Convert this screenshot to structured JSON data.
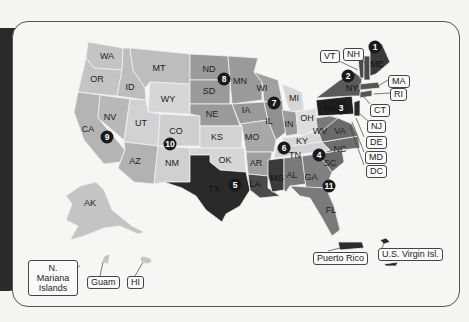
{
  "colors": {
    "c1": "#c9c9c9",
    "c2": "#a8a8a8",
    "c3": "#8a8a8a",
    "c4": "#6e6e6e",
    "c5": "#4a4a4a",
    "c6": "#2b2b2b",
    "light": "#dcdcdc",
    "bg": "#f6f6f4"
  },
  "states": {
    "WA": "WA",
    "OR": "OR",
    "CA": "CA",
    "ID": "ID",
    "NV": "NV",
    "MT": "MT",
    "WY": "WY",
    "UT": "UT",
    "AZ": "AZ",
    "CO": "CO",
    "NM": "NM",
    "ND": "ND",
    "SD": "SD",
    "NE": "NE",
    "KS": "KS",
    "OK": "OK",
    "TX": "TX",
    "MN": "MN",
    "IA": "IA",
    "MO": "MO",
    "AR": "AR",
    "LA": "LA",
    "WI": "WI",
    "IL": "IL",
    "MI": "MI",
    "IN": "IN",
    "OH": "OH",
    "KY": "KY",
    "TN": "TN",
    "MS": "MS",
    "AL": "AL",
    "GA": "GA",
    "FL": "FL",
    "SC": "SC",
    "NC": "NC",
    "VA": "VA",
    "WV": "WV",
    "PA": "PA",
    "NY": "NY",
    "ME": "ME",
    "AK": "AK"
  },
  "callouts": {
    "VT": "VT",
    "NH": "NH",
    "MA": "MA",
    "RI": "RI",
    "CT": "CT",
    "NJ": "NJ",
    "DE": "DE",
    "MD": "MD",
    "DC": "DC",
    "n_mariana": "N. Mariana Islands",
    "guam": "Guam",
    "hi": "HI",
    "puerto_rico": "Puerto Rico",
    "usvi": "U.S. Virgin Isl."
  },
  "markers": [
    "1",
    "2",
    "3",
    "4",
    "5",
    "6",
    "7",
    "8",
    "9",
    "10",
    "11"
  ]
}
